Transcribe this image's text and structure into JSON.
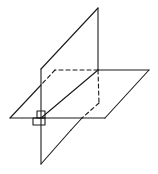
{
  "diagram": {
    "title": "",
    "stroke_color": "#1a1a1a",
    "background": "#ffffff"
  }
}
